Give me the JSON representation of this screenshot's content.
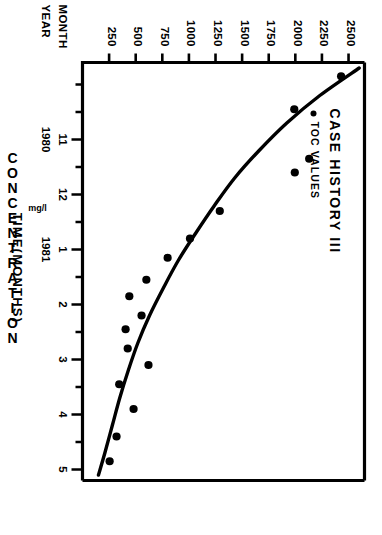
{
  "figure": {
    "legend_title": "CASE HISTORY III",
    "legend_entry": "TOC VALUES",
    "legend_marker": "filled-circle"
  },
  "axes": {
    "y_title": "CONCENTRATION",
    "y_unit": "mg/l",
    "x_title": "TIME(MONTHS)",
    "row_label_month": "MONTH",
    "row_label_year": "YEAR"
  },
  "chart_data": {
    "type": "scatter",
    "title": "CASE HISTORY III",
    "xlabel": "TIME(MONTHS)",
    "ylabel": "CONCENTRATION",
    "yunit": "mg/l",
    "grid": false,
    "legend_position": "top-left",
    "xlim": [
      9.6,
      17.2
    ],
    "ylim": [
      0,
      2650
    ],
    "ytick_values": [
      2500,
      2250,
      2000,
      1750,
      1500,
      1250,
      1000,
      750,
      500,
      250
    ],
    "ytick_labels": [
      "2500",
      "2250",
      "2000",
      "1750",
      "1500",
      "1250",
      "1000",
      "750",
      "500",
      "250"
    ],
    "xtick_month_labels": [
      "11",
      "12",
      "1",
      "2",
      "3",
      "4",
      "5"
    ],
    "xtick_month_values": [
      11,
      12,
      13,
      14,
      15,
      16,
      17
    ],
    "xtick_year_labels": [
      {
        "label": "1980",
        "at": 11
      },
      {
        "label": "1981",
        "at": 13
      }
    ],
    "x_minor_ticks": [
      10,
      10.5,
      11.5,
      12.5,
      13.5,
      14.5,
      15.5,
      16.5
    ],
    "series": [
      {
        "name": "TOC VALUES",
        "marker": "filled-circle",
        "color": "#000000",
        "points": [
          {
            "x": 9.85,
            "y": 2430
          },
          {
            "x": 10.45,
            "y": 1990
          },
          {
            "x": 11.35,
            "y": 2130
          },
          {
            "x": 11.6,
            "y": 1995
          },
          {
            "x": 12.3,
            "y": 1290
          },
          {
            "x": 12.8,
            "y": 1010
          },
          {
            "x": 13.15,
            "y": 800
          },
          {
            "x": 13.55,
            "y": 600
          },
          {
            "x": 13.85,
            "y": 440
          },
          {
            "x": 14.2,
            "y": 555
          },
          {
            "x": 14.45,
            "y": 405
          },
          {
            "x": 14.8,
            "y": 425
          },
          {
            "x": 15.1,
            "y": 620
          },
          {
            "x": 15.45,
            "y": 345
          },
          {
            "x": 15.9,
            "y": 480
          },
          {
            "x": 16.4,
            "y": 320
          },
          {
            "x": 16.85,
            "y": 255
          }
        ]
      }
    ],
    "fit_curve": {
      "name": "fitted exponential decline",
      "color": "#000000",
      "points": [
        {
          "x": 9.7,
          "y": 2600
        },
        {
          "x": 10.2,
          "y": 2230
        },
        {
          "x": 10.7,
          "y": 1920
        },
        {
          "x": 11.2,
          "y": 1660
        },
        {
          "x": 11.7,
          "y": 1430
        },
        {
          "x": 12.2,
          "y": 1240
        },
        {
          "x": 12.7,
          "y": 1065
        },
        {
          "x": 13.2,
          "y": 900
        },
        {
          "x": 13.7,
          "y": 760
        },
        {
          "x": 14.2,
          "y": 630
        },
        {
          "x": 14.7,
          "y": 520
        },
        {
          "x": 15.2,
          "y": 430
        },
        {
          "x": 15.7,
          "y": 350
        },
        {
          "x": 16.2,
          "y": 280
        },
        {
          "x": 16.7,
          "y": 210
        },
        {
          "x": 17.1,
          "y": 150
        }
      ]
    }
  }
}
